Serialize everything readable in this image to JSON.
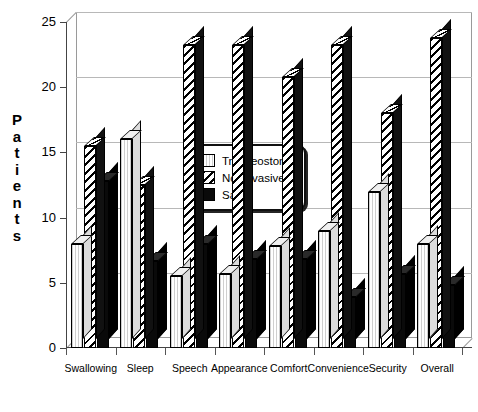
{
  "chart_data": {
    "type": "bar",
    "title": "",
    "xlabel": "",
    "ylabel": "Patients",
    "ylim": [
      0,
      25
    ],
    "yticks": [
      0,
      5,
      10,
      15,
      20,
      25
    ],
    "grid": true,
    "legend_position": "center",
    "style": "3d-grouped-bar",
    "categories": [
      "Swallowing",
      "Sleep",
      "Speech",
      "Appearance",
      "Comfort",
      "Convenience",
      "Security",
      "Overall"
    ],
    "series": [
      {
        "name": "Tracheostomy",
        "pattern": "light-lines",
        "values": [
          8,
          16,
          5.5,
          5.7,
          7.8,
          9,
          12,
          8
        ]
      },
      {
        "name": "Noninvasive",
        "pattern": "diagonal-hatch",
        "values": [
          15.5,
          12.5,
          23.2,
          23.2,
          20.8,
          23.2,
          18,
          23.8
        ]
      },
      {
        "name": "Same",
        "pattern": "solid-black",
        "values": [
          12.8,
          6.7,
          8,
          6.8,
          6.8,
          3.9,
          5.7,
          4.8
        ]
      }
    ]
  },
  "axis": {
    "y_title_letters": [
      "P",
      "a",
      "t",
      "i",
      "e",
      "n",
      "t",
      "s"
    ],
    "y_tick_labels": [
      "25",
      "20",
      "15",
      "10",
      "5",
      "0"
    ]
  },
  "legend": {
    "items": [
      {
        "label": "Tracheostomy",
        "swatch": "light-lines-swatch"
      },
      {
        "label": "Noninvasive",
        "swatch": "diagonal-hatch-swatch"
      },
      {
        "label": "Same",
        "swatch": "solid-black-swatch"
      }
    ]
  },
  "colors": {
    "axis": "#444444",
    "grid": "#b8b8b8",
    "frame": "#9a9a9a",
    "series_same": "#0a0a0a",
    "background": "#ffffff"
  }
}
